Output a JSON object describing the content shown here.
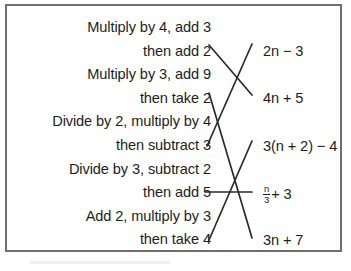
{
  "panel": {
    "border_color": "#6e6e6e",
    "background_color": "#ffffff",
    "text_color": "#1d1d1d"
  },
  "left_column": {
    "align": "right",
    "lines": [
      {
        "id": "l1",
        "text": "Multiply by 4, add 3"
      },
      {
        "id": "l2",
        "text": "then add 2"
      },
      {
        "id": "l3",
        "text": "Multiply by 3, add 9"
      },
      {
        "id": "l4",
        "text": "then take 2"
      },
      {
        "id": "l5",
        "text": "Divide by 2, multiply by 4"
      },
      {
        "id": "l6",
        "text": "then subtract 3"
      },
      {
        "id": "l7",
        "text": "Divide by 3, subtract 2"
      },
      {
        "id": "l8",
        "text": "then add 5"
      },
      {
        "id": "l9",
        "text": "Add 2, multiply by 3"
      },
      {
        "id": "l10",
        "text": "then take 4"
      }
    ]
  },
  "right_column": {
    "items": [
      {
        "id": "r1",
        "text": "2n − 3",
        "top": 37
      },
      {
        "id": "r2",
        "text": "4n + 5",
        "top": 84
      },
      {
        "id": "r3",
        "text": "3(n + 2) − 4",
        "top": 132
      },
      {
        "id": "r4",
        "text": "",
        "top": 179,
        "fraction": {
          "numerator": "n",
          "denominator": "3",
          "suffix": "+ 3"
        }
      },
      {
        "id": "r5",
        "text": "3n + 7",
        "top": 226
      }
    ]
  },
  "connections": [
    {
      "from": "then add 2",
      "to": "4n + 5",
      "x1": 209,
      "y1": 45,
      "x2": 252,
      "y2": 95
    },
    {
      "from": "then take 2",
      "to": "3n + 7",
      "x1": 209,
      "y1": 93,
      "x2": 252,
      "y2": 238
    },
    {
      "from": "then subtract 3",
      "to": "2n − 3",
      "x1": 207,
      "y1": 146,
      "x2": 252,
      "y2": 44
    },
    {
      "from": "then add 5",
      "to": "n/3 + 3",
      "x1": 205,
      "y1": 192,
      "x2": 252,
      "y2": 192
    },
    {
      "from": "then take 4",
      "to": "3(n + 2) − 4",
      "x1": 209,
      "y1": 240,
      "x2": 252,
      "y2": 141
    }
  ],
  "line_color": "#2b2b2b"
}
